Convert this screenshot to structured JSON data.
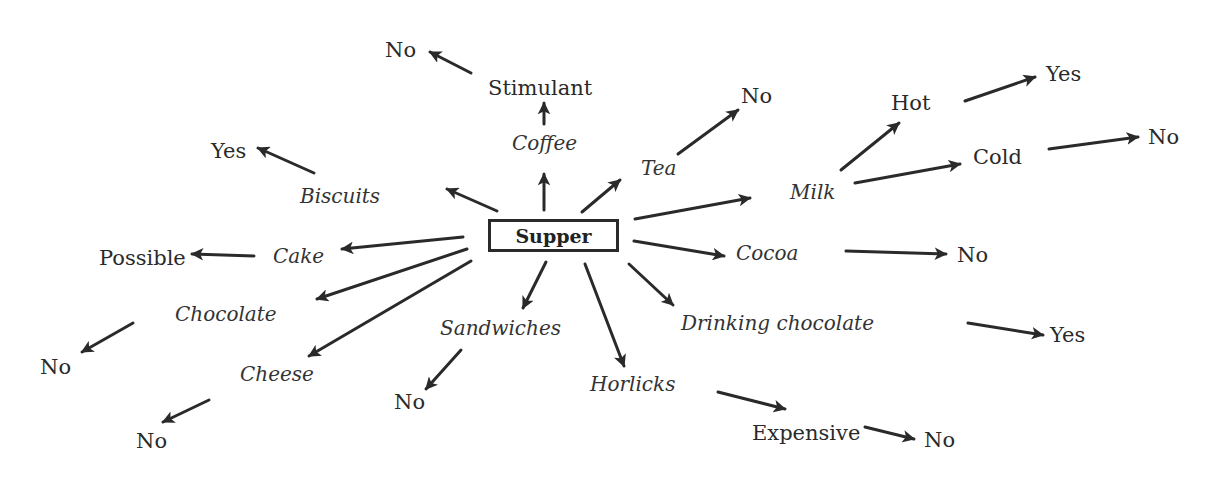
{
  "diagram": {
    "central_node": "Supper",
    "colors": {
      "ink": "#2a2a2a",
      "background": "#ffffff"
    },
    "nodes": {
      "coffee": "Coffee",
      "stimulant": "Stimulant",
      "stimulant_no": "No",
      "tea": "Tea",
      "tea_no": "No",
      "biscuits": "Biscuits",
      "biscuits_yes": "Yes",
      "cake": "Cake",
      "cake_possible": "Possible",
      "chocolate": "Chocolate",
      "chocolate_no": "No",
      "cheese": "Cheese",
      "cheese_no": "No",
      "sandwiches": "Sandwiches",
      "sandwiches_no": "No",
      "horlicks": "Horlicks",
      "expensive": "Expensive",
      "expensive_no": "No",
      "drinking_chocolate": "Drinking chocolate",
      "drinking_chocolate_yes": "Yes",
      "cocoa": "Cocoa",
      "cocoa_no": "No",
      "milk": "Milk",
      "hot": "Hot",
      "hot_yes": "Yes",
      "cold": "Cold",
      "cold_no": "No"
    },
    "edges": [
      [
        "Supper",
        "Coffee"
      ],
      [
        "Coffee",
        "Stimulant"
      ],
      [
        "Stimulant",
        "No"
      ],
      [
        "Supper",
        "Tea"
      ],
      [
        "Tea",
        "No"
      ],
      [
        "Supper",
        "Biscuits"
      ],
      [
        "Biscuits",
        "Yes"
      ],
      [
        "Supper",
        "Cake"
      ],
      [
        "Cake",
        "Possible"
      ],
      [
        "Supper",
        "Chocolate"
      ],
      [
        "Chocolate",
        "No"
      ],
      [
        "Supper",
        "Cheese"
      ],
      [
        "Cheese",
        "No"
      ],
      [
        "Supper",
        "Sandwiches"
      ],
      [
        "Sandwiches",
        "No"
      ],
      [
        "Supper",
        "Horlicks"
      ],
      [
        "Horlicks",
        "Expensive"
      ],
      [
        "Expensive",
        "No"
      ],
      [
        "Supper",
        "Drinking chocolate"
      ],
      [
        "Drinking chocolate",
        "Yes"
      ],
      [
        "Supper",
        "Cocoa"
      ],
      [
        "Cocoa",
        "No"
      ],
      [
        "Supper",
        "Milk"
      ],
      [
        "Milk",
        "Hot"
      ],
      [
        "Hot",
        "Yes"
      ],
      [
        "Milk",
        "Cold"
      ],
      [
        "Cold",
        "No"
      ]
    ]
  }
}
